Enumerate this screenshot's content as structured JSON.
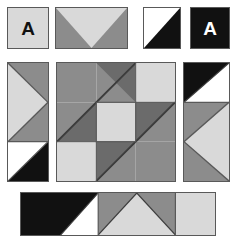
{
  "canvas": {
    "width": 237,
    "height": 243,
    "background": "#ffffff",
    "title": "Geometric tile pattern"
  },
  "palette": {
    "light_gray": "#d9d9d9",
    "medium_gray": "#8c8c8c",
    "dark_gray": "#6b6b6b",
    "black": "#111111",
    "white": "#ffffff",
    "outline": "#595959"
  },
  "labels": {
    "letter_a_dark": "A",
    "letter_a_light": "A"
  },
  "tiles": [
    {
      "id": "tile-top-1",
      "name": "letter-a-light-tile",
      "x": 7,
      "y": 7,
      "w": 42,
      "h": 42,
      "pattern": "solid-light-with-letter",
      "letter": "A",
      "letter_color": "#111111",
      "fill": "#d9d9d9"
    },
    {
      "id": "tile-top-2",
      "name": "chevron-down-tile",
      "x": 55,
      "y": 7,
      "w": 73,
      "h": 42,
      "pattern": "down-triangle-light-on-gray",
      "fill_background": "#8c8c8c",
      "fill_shape": "#d9d9d9"
    },
    {
      "id": "tile-top-3",
      "name": "diagonal-white-black-tile",
      "x": 143,
      "y": 7,
      "w": 38,
      "h": 42,
      "pattern": "diagonal-white-top-black-bottom",
      "fill_background": "#111111",
      "fill_shape": "#ffffff"
    },
    {
      "id": "tile-top-4",
      "name": "letter-a-black-tile",
      "x": 190,
      "y": 7,
      "w": 40,
      "h": 42,
      "pattern": "solid-black-with-letter",
      "letter": "A",
      "letter_color": "#ffffff",
      "fill": "#111111"
    },
    {
      "id": "tile-left",
      "name": "left-column-tile",
      "x": 7,
      "y": 62,
      "w": 42,
      "h": 120,
      "pattern": "right-arrow-over-diagonal"
    },
    {
      "id": "tile-center",
      "name": "center-block-tile",
      "x": 56,
      "y": 62,
      "w": 120,
      "h": 120,
      "pattern": "nine-patch-diagonal-block"
    },
    {
      "id": "tile-right",
      "name": "right-column-tile",
      "x": 183,
      "y": 62,
      "w": 47,
      "h": 120,
      "pattern": "diagonal-over-left-arrow"
    },
    {
      "id": "tile-bottom",
      "name": "bottom-strip-tile",
      "x": 20,
      "y": 192,
      "w": 196,
      "h": 44,
      "pattern": "four-cell-strip"
    }
  ],
  "center_grid": {
    "rows": 3,
    "cols": 3,
    "cells": [
      {
        "name": "center-cell-r1c1",
        "type": "solid",
        "fill": "#8c8c8c"
      },
      {
        "name": "center-cell-r1c2",
        "type": "diagonal-bl-tr",
        "fill_a": "#8c8c8c",
        "fill_b": "#6b6b6b"
      },
      {
        "name": "center-cell-r1c3",
        "type": "solid",
        "fill": "#d9d9d9"
      },
      {
        "name": "center-cell-r2c1",
        "type": "diagonal-bl-tr",
        "fill_a": "#8c8c8c",
        "fill_b": "#6b6b6b"
      },
      {
        "name": "center-cell-r2c2",
        "type": "solid",
        "fill": "#d9d9d9"
      },
      {
        "name": "center-cell-r2c3",
        "type": "diagonal-bl-tr",
        "fill_a": "#6b6b6b",
        "fill_b": "#8c8c8c"
      },
      {
        "name": "center-cell-r3c1",
        "type": "solid",
        "fill": "#d9d9d9"
      },
      {
        "name": "center-cell-r3c2",
        "type": "diagonal-bl-tr",
        "fill_a": "#6b6b6b",
        "fill_b": "#8c8c8c"
      },
      {
        "name": "center-cell-r3c3",
        "type": "solid",
        "fill": "#8c8c8c"
      }
    ]
  },
  "left_column": {
    "cells": [
      {
        "name": "left-cell-top",
        "type": "right-pointing-triangle",
        "fill_background": "#8c8c8c",
        "fill_shape": "#d9d9d9"
      },
      {
        "name": "left-cell-bottom",
        "type": "diagonal-white-black",
        "fill_background": "#111111",
        "fill_shape": "#ffffff"
      }
    ]
  },
  "right_column": {
    "cells": [
      {
        "name": "right-cell-top",
        "type": "diagonal-black-white",
        "fill_background": "#ffffff",
        "fill_shape": "#111111"
      },
      {
        "name": "right-cell-bottom",
        "type": "left-pointing-triangle",
        "fill_background": "#8c8c8c",
        "fill_shape": "#d9d9d9"
      }
    ]
  },
  "bottom_strip": {
    "cells": [
      {
        "name": "bottom-cell-1",
        "type": "black-with-white-corner",
        "fill_background": "#111111",
        "fill_shape": "#ffffff"
      },
      {
        "name": "bottom-cell-2",
        "type": "up-triangle-light-on-gray",
        "fill_background": "#8c8c8c",
        "fill_shape": "#d9d9d9"
      },
      {
        "name": "bottom-cell-3",
        "type": "up-triangle-light-on-gray",
        "fill_background": "#8c8c8c",
        "fill_shape": "#d9d9d9"
      },
      {
        "name": "bottom-cell-4",
        "type": "solid",
        "fill": "#d9d9d9"
      }
    ]
  }
}
